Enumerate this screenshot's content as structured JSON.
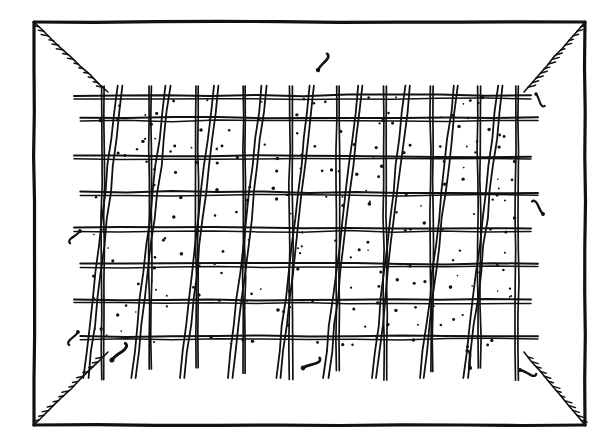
{
  "figure": {
    "style": "black ink line drawing on white, no text labels",
    "background_color": "#ffffff",
    "ink_color": "#111111",
    "canvas": {
      "width": 613,
      "height": 448
    }
  },
  "outer_frame": {
    "name": "box-outline",
    "x1": 34,
    "y1": 22,
    "x2": 585,
    "y2": 425,
    "stroke_width": 3.2,
    "description": "outer rectangle representing the opening of a box or crate seen face-on"
  },
  "perspective_edges": {
    "description": "four hatched diagonal lines running from each outer corner inward to the corresponding corner of the inner panel, suggesting the receding side walls of the box",
    "tick_count_each": 14,
    "tick_length": 6,
    "stroke_width": 1.6,
    "corners": [
      {
        "name": "top-left",
        "from": [
          34,
          22
        ],
        "to": [
          108,
          92
        ]
      },
      {
        "name": "top-right",
        "from": [
          585,
          22
        ],
        "to": [
          524,
          92
        ]
      },
      {
        "name": "bottom-left",
        "from": [
          34,
          425
        ],
        "to": [
          108,
          352
        ]
      },
      {
        "name": "bottom-right",
        "from": [
          585,
          425
        ],
        "to": [
          524,
          352
        ]
      }
    ]
  },
  "inner_panel": {
    "name": "mesh-panel",
    "x1": 88,
    "y1": 92,
    "x2": 524,
    "y2": 352,
    "fill": "#ffffff",
    "description": "stippled rectangular field containing the grid of posts, rails and diagonal braces"
  },
  "vertical_posts": {
    "count": 10,
    "stroke_width": 2.4,
    "top_overhang": 6,
    "bottom_overhang": 26,
    "x_positions": [
      103,
      150,
      197,
      244,
      291,
      338,
      385,
      432,
      479,
      517
    ],
    "description": "evenly spaced upright stakes; each extends a little above the top rail and well below the bottom rail as a foot"
  },
  "horizontal_rails": {
    "count": 8,
    "stroke_width": 3.0,
    "left_overhang": 14,
    "right_overhang": 14,
    "y_positions": [
      96,
      118,
      156,
      192,
      228,
      264,
      300,
      336
    ],
    "description": "double-line horizontal battens spanning the panel; ends stick out past the outer posts on both sides"
  },
  "diagonal_braces": {
    "count": 9,
    "stroke_width": 2.6,
    "lean": "top leans right, bottom leans left",
    "top_offset": 18,
    "bottom_offset": -34,
    "pairs": [
      {
        "top_x": 120,
        "bottom_x": 86
      },
      {
        "top_x": 168,
        "bottom_x": 134
      },
      {
        "top_x": 216,
        "bottom_x": 182
      },
      {
        "top_x": 264,
        "bottom_x": 230
      },
      {
        "top_x": 312,
        "bottom_x": 278
      },
      {
        "top_x": 360,
        "bottom_x": 326
      },
      {
        "top_x": 408,
        "bottom_x": 374
      },
      {
        "top_x": 456,
        "bottom_x": 422
      },
      {
        "top_x": 500,
        "bottom_x": 466
      }
    ],
    "description": "long slanted laths crossing the posts, each drawn as a narrow double line so they read as thin flat slats"
  },
  "stipple": {
    "description": "scattered small ink dots filling the cells of the mesh to suggest texture / shading of the surface behind",
    "dot_count": 220,
    "dot_radius": 1.3,
    "color": "#111111"
  },
  "debris_marks": {
    "description": "small curved comma-like ink marks floating around the panel, like bent wire clips or fallen twigs",
    "items": [
      {
        "name": "debris-top-center",
        "x": 318,
        "y": 70,
        "rotation": 10,
        "scale": 1.0
      },
      {
        "name": "debris-right-upper",
        "x": 536,
        "y": 94,
        "rotation": 125,
        "scale": 0.8
      },
      {
        "name": "debris-left-mid",
        "x": 80,
        "y": 231,
        "rotation": 200,
        "scale": 0.85
      },
      {
        "name": "debris-right-mid",
        "x": 543,
        "y": 214,
        "rotation": 300,
        "scale": 0.9
      },
      {
        "name": "debris-left-lower",
        "x": 78,
        "y": 332,
        "rotation": 195,
        "scale": 0.85
      },
      {
        "name": "debris-bottom-left",
        "x": 112,
        "y": 360,
        "rotation": 20,
        "scale": 1.15
      },
      {
        "name": "debris-bottom-mid",
        "x": 303,
        "y": 368,
        "rotation": 40,
        "scale": 1.05
      },
      {
        "name": "debris-bottom-right",
        "x": 470,
        "y": 368,
        "rotation": 330,
        "scale": 0.95
      },
      {
        "name": "debris-corner-right",
        "x": 520,
        "y": 370,
        "rotation": 85,
        "scale": 0.9
      }
    ]
  }
}
